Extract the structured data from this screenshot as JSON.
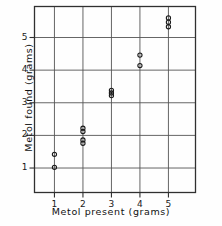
{
  "figure": {
    "background_color": "#fefefe",
    "frame_color": "#303030",
    "grid_color": "#555555",
    "marker_color": "#1a1a1a"
  },
  "chart_data": {
    "type": "scatter",
    "title": "",
    "xlabel": "Metol present (grams)",
    "ylabel": "Metol found (grams)",
    "xlim": [
      0.3,
      5.95
    ],
    "ylim": [
      0.25,
      5.95
    ],
    "xticks": [
      "1",
      "2",
      "3",
      "4",
      "5"
    ],
    "xtick_values": [
      1,
      2,
      3,
      4,
      5
    ],
    "yticks": [
      "1",
      "2",
      "3",
      "4",
      "5"
    ],
    "ytick_values": [
      1,
      2,
      3,
      4,
      5
    ],
    "grid": true,
    "grid_axes": "both",
    "legend": null,
    "marker": "open-circle",
    "marker_size": 3,
    "points": [
      {
        "x": 1,
        "y": 1.42
      },
      {
        "x": 1,
        "y": 1.02
      },
      {
        "x": 2,
        "y": 2.22
      },
      {
        "x": 2,
        "y": 2.12
      },
      {
        "x": 2,
        "y": 1.86
      },
      {
        "x": 2,
        "y": 1.76
      },
      {
        "x": 3,
        "y": 3.38
      },
      {
        "x": 3,
        "y": 3.3
      },
      {
        "x": 3,
        "y": 3.22
      },
      {
        "x": 4,
        "y": 4.46
      },
      {
        "x": 4,
        "y": 4.14
      },
      {
        "x": 5,
        "y": 5.6
      },
      {
        "x": 5,
        "y": 5.47
      },
      {
        "x": 5,
        "y": 5.33
      }
    ]
  }
}
